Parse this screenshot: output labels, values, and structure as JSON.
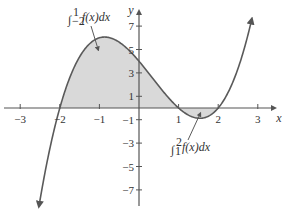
{
  "diagram": {
    "title": "",
    "function": "f(x) = (x+2)(x-1)(x-2)",
    "colors": {
      "curve": "#5a5a5a",
      "axis": "#555555",
      "shade": "#d9d9d9",
      "text": "#333333"
    },
    "axes": {
      "x_label": "x",
      "y_label": "y",
      "x_ticks": [
        {
          "value": -3,
          "label": "−3"
        },
        {
          "value": -2,
          "label": "−2"
        },
        {
          "value": -1,
          "label": "−1"
        },
        {
          "value": 1,
          "label": "1"
        },
        {
          "value": 2,
          "label": "2"
        },
        {
          "value": 3,
          "label": "3"
        }
      ],
      "y_ticks": [
        {
          "value": 7,
          "label": "7"
        },
        {
          "value": 5,
          "label": "5"
        },
        {
          "value": 3,
          "label": "3"
        },
        {
          "value": 1,
          "label": "1"
        },
        {
          "value": -1,
          "label": "−1"
        },
        {
          "value": -3,
          "label": "−3"
        },
        {
          "value": -5,
          "label": "−5"
        },
        {
          "value": -7,
          "label": "−7"
        }
      ]
    },
    "annotations": [
      {
        "id": "integral-left",
        "text": "∫₋₂¹ f(x)dx",
        "lower": "−2",
        "upper": "1",
        "body": "f(x)dx",
        "region": [
          -2,
          1
        ]
      },
      {
        "id": "integral-right",
        "text": "∫₁² f(x)dx",
        "lower": "1",
        "upper": "2",
        "body": "f(x)dx",
        "region": [
          1,
          2
        ]
      }
    ]
  }
}
